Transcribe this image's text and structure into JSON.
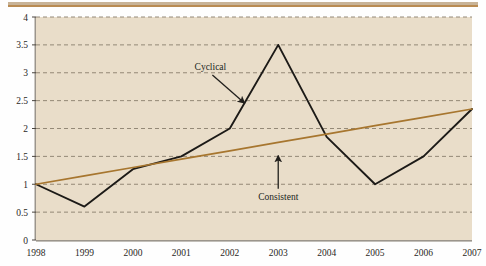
{
  "figure": {
    "background_color": "#fefefe",
    "plot_background_color": "#e9ddc9",
    "rule_color": "#b98b52"
  },
  "chart_data": {
    "type": "line",
    "title": "",
    "subtitle": "",
    "xlabel": "",
    "ylabel": "",
    "x": [
      1998,
      1999,
      2000,
      2001,
      2002,
      2003,
      2004,
      2005,
      2006,
      2007
    ],
    "categories": [
      "1998",
      "1999",
      "2000",
      "2001",
      "2002",
      "2003",
      "2004",
      "2005",
      "2006",
      "2007"
    ],
    "xlim": [
      1998,
      2007
    ],
    "ylim": [
      0,
      4
    ],
    "ytick_labels": [
      "0",
      "0.5",
      "1",
      "1.5",
      "2",
      "2.5",
      "3",
      "3.5",
      "4"
    ],
    "ytick_values": [
      0,
      0.5,
      1,
      1.5,
      2,
      2.5,
      3,
      3.5,
      4
    ],
    "grid": "horizontal-dashed",
    "legend": "none",
    "series": [
      {
        "name": "Cyclical",
        "color": "#1c1a17",
        "values": [
          1.0,
          0.6,
          1.27,
          1.5,
          2.0,
          3.5,
          1.85,
          1.0,
          1.5,
          2.35
        ]
      },
      {
        "name": "Consistent",
        "color": "#a7762f",
        "values": [
          1.0,
          1.15,
          1.3,
          1.45,
          1.6,
          1.75,
          1.9,
          2.05,
          2.2,
          2.35
        ]
      }
    ],
    "annotations": [
      {
        "label": "Cyclical",
        "target_series": "Cyclical",
        "x": 2001.6,
        "y": 3.05,
        "arrow": "down-right"
      },
      {
        "label": "Consistent",
        "target_series": "Consistent",
        "x": 2003.0,
        "y": 0.72,
        "arrow": "up"
      }
    ]
  }
}
